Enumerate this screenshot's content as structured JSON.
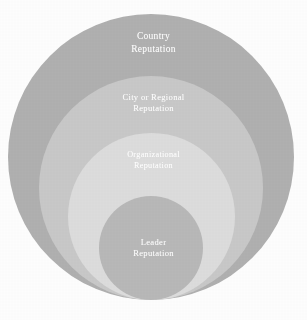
{
  "figure": {
    "type": "nested-circles-diagram",
    "title": "",
    "background_color": "#fdfdfd",
    "text_color": "#ffffff"
  },
  "circles": [
    {
      "id": "country",
      "label": "Country\nReputation",
      "label_line1": "Country",
      "label_line2": "Reputation",
      "level": 1,
      "color": "#b0b0b0",
      "diameter_px": 286,
      "center_x_px": 151,
      "bottom_y_px": 300,
      "label_y_px": 30
    },
    {
      "id": "city-or-regional",
      "label": "City or Regional\nReputation",
      "label_line1": "City or Regional",
      "label_line2": "Reputation",
      "level": 2,
      "color": "#c8c8c8",
      "diameter_px": 224,
      "center_x_px": 151,
      "bottom_y_px": 300,
      "label_y_px": 92
    },
    {
      "id": "organizational",
      "label": "Organizational\nReputation",
      "label_line1": "Organizational",
      "label_line2": "Reputation",
      "level": 3,
      "color": "#dcdcdc",
      "diameter_px": 167,
      "center_x_px": 151,
      "bottom_y_px": 300,
      "label_y_px": 150
    },
    {
      "id": "leader",
      "label": "Leader\nReputation",
      "label_line1": "Leader",
      "label_line2": "Reputation",
      "level": 4,
      "color": "#b8b8b8",
      "diameter_px": 104,
      "center_x_px": 151,
      "bottom_y_px": 300,
      "label_y_px": 237
    }
  ]
}
